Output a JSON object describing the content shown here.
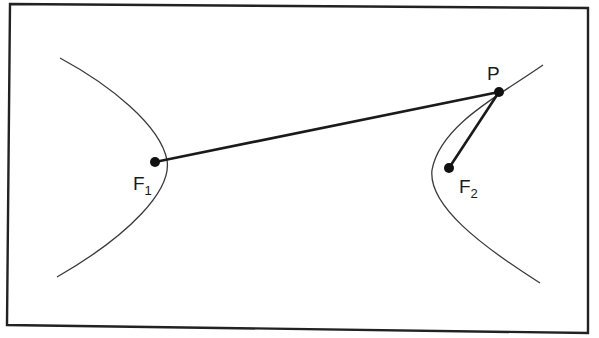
{
  "diagram": {
    "colors": {
      "background": "#ffffff",
      "frame": "#222222",
      "curve": "#3a3a3a",
      "segment": "#1a1a1a",
      "point": "#111111",
      "label": "#1a1a1a"
    },
    "points": {
      "F1": {
        "label_main": "F",
        "label_sub": "1",
        "x": 155,
        "y": 162
      },
      "F2": {
        "label_main": "F",
        "label_sub": "2",
        "x": 449,
        "y": 168
      },
      "P": {
        "label_main": "P",
        "x": 499,
        "y": 92
      }
    },
    "segments": [
      {
        "from": "F1",
        "to": "P"
      },
      {
        "from": "F2",
        "to": "P"
      }
    ],
    "curves": {
      "left_branch": "hyperbola branch opening left, enclosing F1",
      "right_branch": "hyperbola branch opening right, enclosing F2, passing through P"
    }
  }
}
